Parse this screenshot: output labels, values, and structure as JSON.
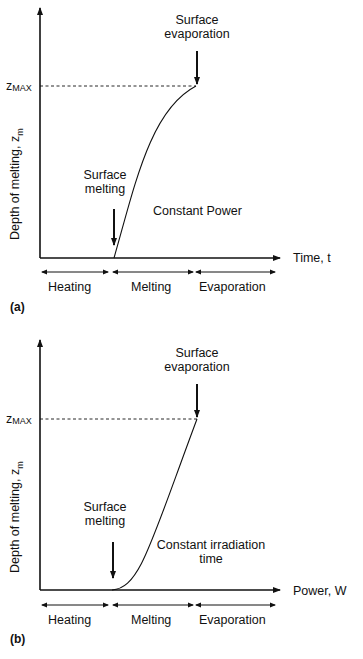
{
  "panels": [
    {
      "id": "a",
      "tag": "(a)",
      "y_axis_label": "Depth of melting, z",
      "y_axis_label_sub": "m",
      "x_axis_label": "Time, t",
      "zmax_label": "z",
      "zmax_sub": "MAX",
      "annotation_top": [
        "Surface",
        "evaporation"
      ],
      "annotation_bottom": [
        "Surface",
        "melting"
      ],
      "condition": [
        "Constant Power"
      ],
      "phases": [
        "Heating",
        "Melting",
        "Evaporation"
      ],
      "curve_shape": "concave-down (rises steeply then flattens toward zMAX)"
    },
    {
      "id": "b",
      "tag": "(b)",
      "y_axis_label": "Depth of melting, z",
      "y_axis_label_sub": "m",
      "x_axis_label": "Power, W",
      "zmax_label": "z",
      "zmax_sub": "MAX",
      "annotation_top": [
        "Surface",
        "evaporation"
      ],
      "annotation_bottom": [
        "Surface",
        "melting"
      ],
      "condition": [
        "Constant irradiation",
        "time"
      ],
      "phases": [
        "Heating",
        "Melting",
        "Evaporation"
      ],
      "curve_shape": "concave-up (starts flat then rises steeply to zMAX)"
    }
  ],
  "colors": {
    "line": "#111111",
    "background": "#ffffff"
  }
}
